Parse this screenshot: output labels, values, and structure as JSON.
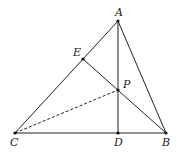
{
  "diagram": {
    "type": "geometry",
    "points": {
      "A": {
        "label": "A",
        "x": 118,
        "y": 21,
        "lx": 115,
        "ly": 16
      },
      "E": {
        "label": "E",
        "x": 83,
        "y": 59,
        "lx": 73,
        "ly": 56
      },
      "P": {
        "label": "P",
        "x": 118,
        "y": 90,
        "lx": 123,
        "ly": 88
      },
      "C": {
        "label": "C",
        "x": 15,
        "y": 133,
        "lx": 10,
        "ly": 146
      },
      "D": {
        "label": "D",
        "x": 118,
        "y": 133,
        "lx": 114,
        "ly": 146
      },
      "B": {
        "label": "B",
        "x": 166,
        "y": 133,
        "lx": 162,
        "ly": 146
      }
    },
    "segments": [
      {
        "from": "A",
        "to": "C",
        "style": "solid"
      },
      {
        "from": "A",
        "to": "B",
        "style": "solid"
      },
      {
        "from": "C",
        "to": "B",
        "style": "solid"
      },
      {
        "from": "A",
        "to": "D",
        "style": "solid"
      },
      {
        "from": "E",
        "to": "B",
        "style": "solid"
      },
      {
        "from": "C",
        "to": "P",
        "style": "dashed"
      }
    ],
    "colors": {
      "stroke": "#222222",
      "background": "#ffffff"
    }
  }
}
